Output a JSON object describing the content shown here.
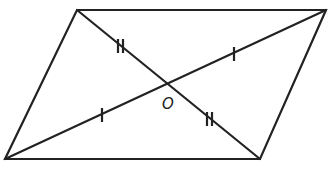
{
  "diagram": {
    "type": "parallelogram-with-diagonals",
    "stroke_color": "#222222",
    "background": "#ffffff",
    "vertices": {
      "top_left": [
        77,
        10
      ],
      "top_right": [
        326,
        10
      ],
      "bottom_right": [
        260,
        159
      ],
      "bottom_left": [
        5,
        159
      ]
    },
    "center": [
      166,
      85
    ],
    "center_label": "O",
    "tick_marks": [
      {
        "segment": "top_left-center",
        "count": 2
      },
      {
        "segment": "center-bottom_right",
        "count": 2
      },
      {
        "segment": "bottom_left-center",
        "count": 1
      },
      {
        "segment": "center-top_right",
        "count": 1
      }
    ]
  }
}
